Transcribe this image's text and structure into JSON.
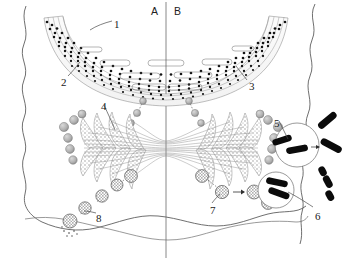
{
  "figure": {
    "region_labels": [
      {
        "id": "region-a",
        "text": "A",
        "x": 151,
        "y": 6
      },
      {
        "id": "region-b",
        "text": "B",
        "x": 174,
        "y": 6
      }
    ],
    "callouts": [
      {
        "id": "callout-1",
        "text": "1",
        "x": 114,
        "y": 19
      },
      {
        "id": "callout-2",
        "text": "2",
        "x": 61,
        "y": 77
      },
      {
        "id": "callout-3",
        "text": "3",
        "x": 249,
        "y": 81
      },
      {
        "id": "callout-4",
        "text": "4",
        "x": 101,
        "y": 101
      },
      {
        "id": "callout-5",
        "text": "5",
        "x": 274,
        "y": 118
      },
      {
        "id": "callout-6",
        "text": "6",
        "x": 315,
        "y": 211
      },
      {
        "id": "callout-7",
        "text": "7",
        "x": 210,
        "y": 205
      },
      {
        "id": "callout-8",
        "text": "8",
        "x": 96,
        "y": 213
      }
    ],
    "colors": {
      "outline": "#3a3a3a",
      "chromosome_fill": "#0a0a0a",
      "stipple_gray": "#9a9a9a",
      "fiber_gray": "#8c8c8c",
      "background": "#ffffff",
      "label_text": "#1a1a1a"
    },
    "parts": {
      "cell_boundary": "wavy-cell-membrane",
      "upper_band": "layered-dotted-arc-band",
      "spindle": "stippled-spindle-fibers",
      "chromosome_groups": "dark-rod-chromosomes",
      "stipple_chain": "stippled-granule-chain",
      "divider": "vertical-axis-line"
    }
  }
}
